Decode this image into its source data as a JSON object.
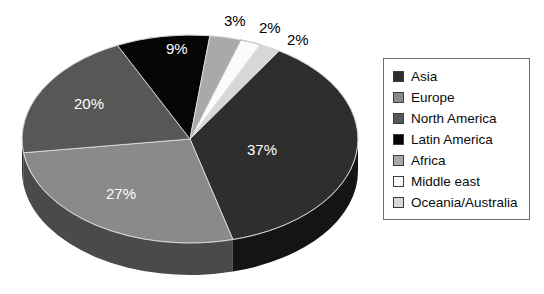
{
  "chart_data": {
    "type": "pie",
    "title": "",
    "subtitle": "",
    "xlabel": "",
    "ylabel": "",
    "grid": false,
    "three_d": true,
    "legend_position": "right",
    "units": "percent",
    "categories": [
      "Asia",
      "Europe",
      "North America",
      "Latin America",
      "Africa",
      "Middle east",
      "Oceania/Australia"
    ],
    "values": [
      37,
      27,
      20,
      9,
      3,
      2,
      2
    ],
    "value_labels": [
      "37%",
      "27%",
      "20%",
      "9%",
      "3%",
      "2%",
      "2%"
    ],
    "colors": [
      "#2e2e2e",
      "#8a8a8a",
      "#575757",
      "#050505",
      "#a9a9a9",
      "#fbfbfb",
      "#d7d7d7"
    ],
    "side_colors": [
      "#141414",
      "#4a4a4a",
      "#2b2b2b",
      "#000000",
      "#5e5e5e",
      "#8f8f8f",
      "#767676"
    ],
    "slices": [
      {
        "name": "Asia",
        "value": 37,
        "label": "37%",
        "color": "#2e2e2e",
        "label_placement": "inside"
      },
      {
        "name": "Europe",
        "value": 27,
        "label": "27%",
        "color": "#8a8a8a",
        "label_placement": "inside"
      },
      {
        "name": "North America",
        "value": 20,
        "label": "20%",
        "color": "#575757",
        "label_placement": "inside"
      },
      {
        "name": "Latin America",
        "value": 9,
        "label": "9%",
        "color": "#050505",
        "label_placement": "inside"
      },
      {
        "name": "Africa",
        "value": 3,
        "label": "3%",
        "color": "#a9a9a9",
        "label_placement": "outside"
      },
      {
        "name": "Middle east",
        "value": 2,
        "label": "2%",
        "color": "#fbfbfb",
        "label_placement": "outside"
      },
      {
        "name": "Oceania/Australia",
        "value": 2,
        "label": "2%",
        "color": "#d7d7d7",
        "label_placement": "outside"
      }
    ]
  },
  "labels": {
    "asia": "37%",
    "europe": "27%",
    "north_america": "20%",
    "latin_america": "9%",
    "africa": "3%",
    "middle_east": "2%",
    "oceania": "2%"
  },
  "legend": {
    "items": [
      {
        "label": "Asia",
        "color": "#2e2e2e"
      },
      {
        "label": "Europe",
        "color": "#8a8a8a"
      },
      {
        "label": "North America",
        "color": "#575757"
      },
      {
        "label": "Latin America",
        "color": "#050505"
      },
      {
        "label": "Africa",
        "color": "#a9a9a9"
      },
      {
        "label": "Middle east",
        "color": "#fbfbfb"
      },
      {
        "label": "Oceania/Australia",
        "color": "#d7d7d7"
      }
    ]
  }
}
